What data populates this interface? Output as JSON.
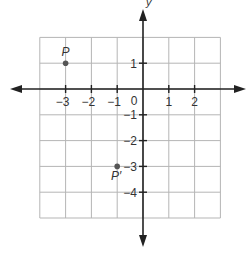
{
  "figure": {
    "type": "coordinate-plane",
    "y_axis_label": "y",
    "x_ticks": [
      {
        "value": -3,
        "label": "−3"
      },
      {
        "value": -2,
        "label": "−2"
      },
      {
        "value": -1,
        "label": "−1"
      },
      {
        "value": 1,
        "label": "1"
      },
      {
        "value": 2,
        "label": "2"
      }
    ],
    "y_ticks": [
      {
        "value": 1,
        "label": "1"
      },
      {
        "value": -1,
        "label": "−1"
      },
      {
        "value": -2,
        "label": "−2"
      },
      {
        "value": -3,
        "label": "−3"
      },
      {
        "value": -4,
        "label": "−4"
      }
    ],
    "origin_label": "0",
    "grid": {
      "x_min": -4,
      "x_max": 3,
      "y_min": -5,
      "y_max": 2
    },
    "points": [
      {
        "name": "P",
        "x": -3,
        "y": 1
      },
      {
        "name": "P′",
        "x": -1,
        "y": -3
      }
    ],
    "colors": {
      "grid": "#b5b5b5",
      "axis": "#222222",
      "point": "#555555",
      "label": "#333333"
    }
  }
}
